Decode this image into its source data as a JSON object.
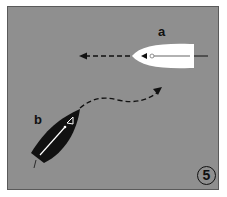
{
  "diagram": {
    "type": "sailing-right-of-way",
    "background_color": "#8f8f8f",
    "boats": [
      {
        "id": "a",
        "label": "a",
        "hull_color": "#ffffff",
        "heading": "west",
        "path": "straight-dashed-left"
      },
      {
        "id": "b",
        "label": "b",
        "hull_color": "#111111",
        "heading": "northeast",
        "path": "curved-dashed-right"
      }
    ],
    "panel_number": "5"
  }
}
